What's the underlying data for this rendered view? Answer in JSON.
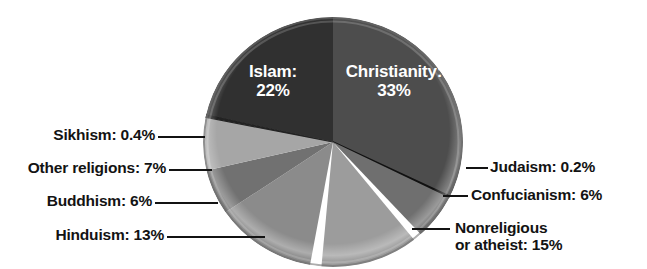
{
  "chart_data": {
    "type": "pie",
    "title": "",
    "subtitle": "",
    "xlabel": "",
    "ylabel": "",
    "legend_position": "none",
    "grid": false,
    "units": "percent of world population",
    "categories": [
      "Christianity",
      "Judaism",
      "Confucianism",
      "Nonreligious or atheist",
      "Hinduism",
      "Buddhism",
      "Other religions",
      "Sikhism",
      "Islam"
    ],
    "values": [
      33,
      0.2,
      6,
      15,
      13,
      6,
      7,
      0.4,
      22
    ],
    "slices": [
      {
        "name": "Christianity",
        "value": 33,
        "display": "33%",
        "label_text": "Christianity:",
        "value_text": "33%",
        "color": "#4d4d4d",
        "label_placement": "inside"
      },
      {
        "name": "Judaism",
        "value": 0.2,
        "display": "0.2%",
        "label_text": "Judaism: 0.2%",
        "color": "#111111",
        "label_placement": "outside-right"
      },
      {
        "name": "Confucianism",
        "value": 6,
        "display": "6%",
        "label_text": "Confucianism: 6%",
        "color": "#6f6f6f",
        "label_placement": "outside-right"
      },
      {
        "name": "Nonreligious or atheist",
        "value": 15,
        "display": "15%",
        "label_text": "Nonreligious",
        "label_text_line2": "or atheist: 15%",
        "color": "#9c9c9c",
        "label_placement": "outside-right"
      },
      {
        "name": "Hinduism",
        "value": 13,
        "display": "13%",
        "label_text": "Hinduism: 13%",
        "color": "#8b8b8b",
        "label_placement": "outside-left"
      },
      {
        "name": "Buddhism",
        "value": 6,
        "display": "6%",
        "label_text": "Buddhism: 6%",
        "color": "#717171",
        "label_placement": "outside-left"
      },
      {
        "name": "Other religions",
        "value": 7,
        "display": "7%",
        "label_text": "Other religions: 7%",
        "color": "#a6a6a6",
        "label_placement": "outside-left"
      },
      {
        "name": "Sikhism",
        "value": 0.4,
        "display": "0.4%",
        "label_text": "Sikhism: 0.4%",
        "color": "#232323",
        "label_placement": "outside-left"
      },
      {
        "name": "Islam",
        "value": 22,
        "display": "22%",
        "label_text": "Islam:",
        "value_text": "22%",
        "color": "#303030",
        "label_placement": "inside"
      }
    ]
  },
  "labels": {
    "islam_name": "Islam:",
    "islam_pct": "22%",
    "christianity_name": "Christianity:",
    "christianity_pct": "33%",
    "sikhism": "Sikhism: 0.4%",
    "other_religions": "Other religions: 7%",
    "buddhism": "Buddhism: 6%",
    "hinduism": "Hinduism: 13%",
    "judaism": "Judaism: 0.2%",
    "confucianism": "Confucianism: 6%",
    "nonreligious_line1": "Nonreligious",
    "nonreligious_line2": "or atheist: 15%"
  },
  "colors": {
    "background": "#ffffff",
    "text": "#131313",
    "inside_text": "#ffffff",
    "leader_line": "#131313"
  }
}
